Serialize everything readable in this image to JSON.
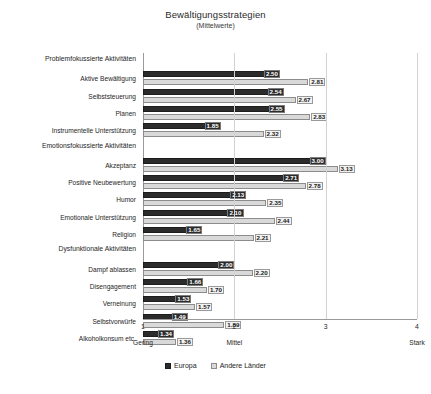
{
  "chart_data": {
    "type": "bar",
    "orientation": "horizontal",
    "title": "Bewältigungsstrategien",
    "subtitle": "(Mittelwerte)",
    "xlabel": "",
    "ylabel": "",
    "xlim": [
      1,
      4
    ],
    "xticks": [
      1,
      2,
      3,
      4
    ],
    "xtick_labels": [
      "1",
      "2",
      "3",
      "4"
    ],
    "anchor_labels": [
      {
        "value": 1,
        "text": "Gering"
      },
      {
        "value": 2,
        "text": "Mittel"
      },
      {
        "value": 4,
        "text": "Stark"
      }
    ],
    "grid": true,
    "legend_position": "bottom",
    "series": [
      {
        "name": "Europa",
        "color": "#2b2b2b"
      },
      {
        "name": "Andere Länder",
        "color": "#d9d9d9"
      }
    ],
    "groups": [
      {
        "heading": "Problemfokussierte Aktivitäten",
        "rows": [
          {
            "label": "Aktive Bewältigung",
            "europa": 2.5,
            "andere": 2.81
          },
          {
            "label": "Selbststeuerung",
            "europa": 2.54,
            "andere": 2.67
          },
          {
            "label": "Planen",
            "europa": 2.55,
            "andere": 2.83
          },
          {
            "label": "Instrumentelle Unterstützung",
            "europa": 1.85,
            "andere": 2.32
          }
        ]
      },
      {
        "heading": "Emotionsfokussierte Aktivitäten",
        "rows": [
          {
            "label": "Akzeptanz",
            "europa": 3.0,
            "andere": 3.13
          },
          {
            "label": "Positive Neubewertung",
            "europa": 2.71,
            "andere": 2.78
          },
          {
            "label": "Humor",
            "europa": 2.13,
            "andere": 2.35
          },
          {
            "label": "Emotionale Unterstützung",
            "europa": 2.1,
            "andere": 2.44
          },
          {
            "label": "Religion",
            "europa": 1.65,
            "andere": 2.21
          }
        ]
      },
      {
        "heading": "Dysfunktionale Aktivitäten",
        "rows": [
          {
            "label": "Dampf ablassen",
            "europa": 2.0,
            "andere": 2.2
          },
          {
            "label": "Disengagement",
            "europa": 1.66,
            "andere": 1.7
          },
          {
            "label": "Verneinung",
            "europa": 1.53,
            "andere": 1.57
          },
          {
            "label": "Selbstvorwürfe",
            "europa": 1.49,
            "andere": 1.89
          },
          {
            "label": "Alkoholkonsum etc.",
            "europa": 1.34,
            "andere": 1.36
          }
        ]
      }
    ]
  }
}
